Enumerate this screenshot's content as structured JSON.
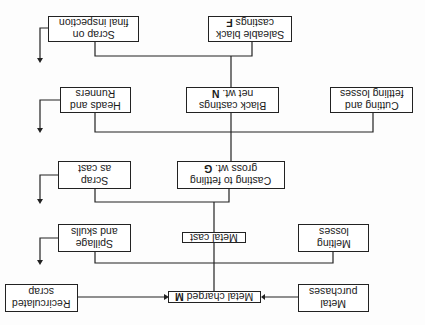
{
  "orientation": "rotated-180",
  "nodes": {
    "scrap_final": {
      "label": "Scrap on\nfinal inspection"
    },
    "saleable": {
      "label": "Saleable black\ncastings ",
      "var": "F"
    },
    "heads": {
      "label": "Heads and\nRunners"
    },
    "black_castings": {
      "label": "Black castings\nnet wt. ",
      "var": "N"
    },
    "cutting": {
      "label": "Cutting and\nfettling losses"
    },
    "scrap_cast": {
      "label": "Scrap\nas cast"
    },
    "fettling": {
      "label": "Casting to fettling\ngross wt. ",
      "var": "G"
    },
    "spillage": {
      "label": "Spillage\nand skulls"
    },
    "metal_cast": {
      "label": "Metal cast"
    },
    "melting": {
      "label": "Melting\nlosses"
    },
    "recirculated": {
      "label": "Recirculated\nscrap"
    },
    "metal_charged": {
      "label": "Metal charged ",
      "var": "M"
    },
    "purchases": {
      "label": "Metal\npurchases"
    }
  }
}
